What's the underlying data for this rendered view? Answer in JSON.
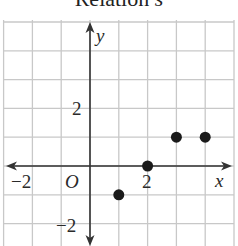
{
  "title": {
    "text": "Relation",
    "var": "s"
  },
  "chart_data": {
    "type": "scatter",
    "title": "Relation s",
    "xlabel": "x",
    "ylabel": "y",
    "origin_label": "O",
    "x_tick_labels": [
      {
        "value": -2,
        "label": "−2"
      },
      {
        "value": 2,
        "label": "2"
      }
    ],
    "y_tick_labels": [
      {
        "value": 2,
        "label": "2"
      },
      {
        "value": -2,
        "label": "−2"
      }
    ],
    "xlim": [
      -3,
      5
    ],
    "ylim": [
      -3,
      5
    ],
    "grid": true,
    "points": [
      {
        "x": 1,
        "y": -1
      },
      {
        "x": 2,
        "y": 0
      },
      {
        "x": 3,
        "y": 1
      },
      {
        "x": 4,
        "y": 1
      }
    ],
    "colors": {
      "grid": "#c8c8c8",
      "axis": "#333333",
      "point": "#1a1a1a"
    }
  }
}
